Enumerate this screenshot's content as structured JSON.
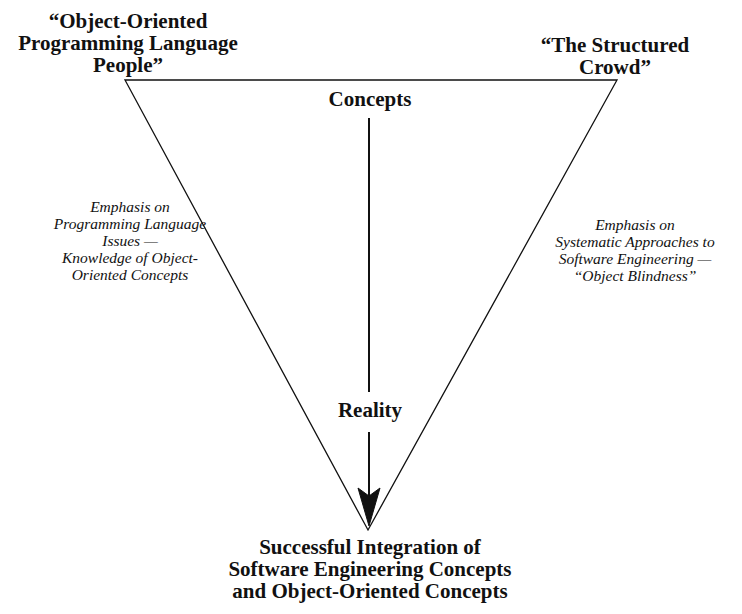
{
  "diagram": {
    "type": "inverted-triangle",
    "corners": {
      "top_left": {
        "label": "“Object-Oriented\nProgramming Language\nPeople”"
      },
      "top_right": {
        "label": "“The Structured\nCrowd”"
      },
      "bottom": {
        "label": "Successful Integration of\nSoftware Engineering Concepts\nand Object-Oriented Concepts"
      }
    },
    "sides": {
      "left": {
        "label": "Emphasis on\nProgramming Language\nIssues —\nKnowledge of Object-\nOriented Concepts"
      },
      "right": {
        "label": "Emphasis on\nSystematic Approaches to\nSoftware Engineering —\n“Object Blindness”"
      }
    },
    "center_axis": {
      "top_label": "Concepts",
      "middle_label": "Reality",
      "direction": "down",
      "arrow_icon": "arrow-down-icon"
    },
    "colors": {
      "line": "#111111",
      "background": "#ffffff"
    }
  }
}
